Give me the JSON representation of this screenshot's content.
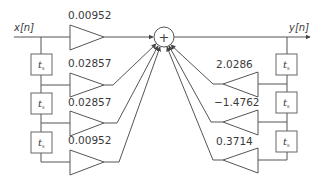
{
  "diagram": {
    "type": "IIR filter block diagram (direct form)",
    "input_label": "x[n]",
    "output_label": "y[n]",
    "summer_symbol": "+",
    "delay_label": "t",
    "delay_subscript": "s",
    "feedforward_gains": [
      "0.00952",
      "0.02857",
      "0.02857",
      "0.00952"
    ],
    "feedback_gains": [
      "2.0286",
      "−1.4762",
      "0.3714"
    ],
    "left_delay_count": 3,
    "right_delay_count": 3
  }
}
